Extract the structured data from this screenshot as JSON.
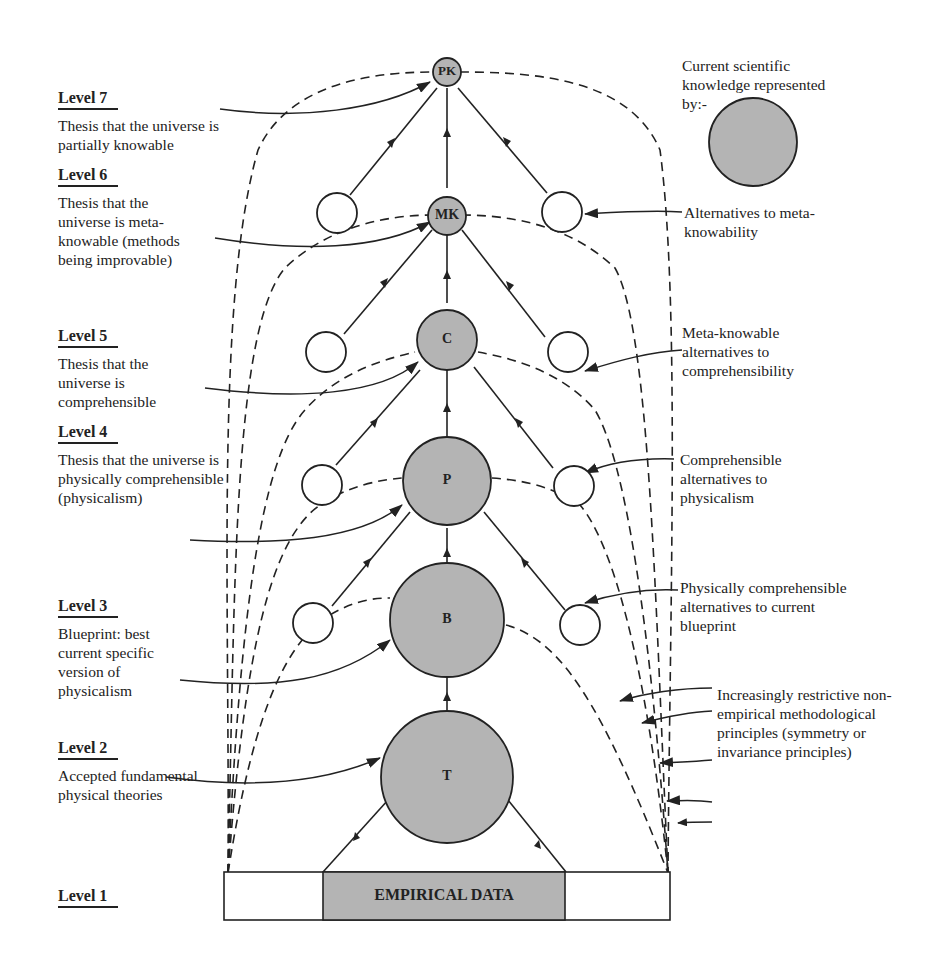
{
  "levels": [
    {
      "title": "Level 7",
      "desc": "Thesis that the universe is partially knowable"
    },
    {
      "title": "Level 6",
      "desc": "Thesis that the universe is meta-knowable (methods being improvable)"
    },
    {
      "title": "Level 5",
      "desc": "Thesis that the universe is comprehensible"
    },
    {
      "title": "Level 4",
      "desc": "Thesis that the universe is physically comprehensible (physicalism)"
    },
    {
      "title": "Level 3",
      "desc": "Blueprint: best current specific version of physicalism"
    },
    {
      "title": "Level 2",
      "desc": "Accepted fundamental physical theories"
    },
    {
      "title": "Level 1",
      "desc": ""
    }
  ],
  "nodes": {
    "pk": "PK",
    "mk": "MK",
    "c": "C",
    "p": "P",
    "b": "B",
    "t": "T"
  },
  "base": {
    "label": "EMPIRICAL DATA"
  },
  "legend": {
    "text": "Current scientific knowledge represented by:-"
  },
  "right_labels": {
    "alt_meta": "Alternatives to meta-knowability",
    "alt_comp": "Meta-knowable alternatives to comprehensibility",
    "alt_phys": "Comprehensible alternatives to physicalism",
    "alt_blue": "Physically comprehensible alternatives to current blueprint",
    "principles": "Increasingly restrictive non-empirical methodological principles (symmetry or invariance principles)"
  },
  "colors": {
    "knowledge_fill": "#b4b4b4",
    "line": "#222222",
    "background": "#ffffff"
  }
}
